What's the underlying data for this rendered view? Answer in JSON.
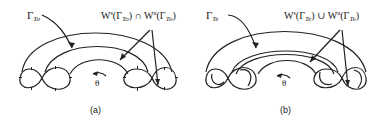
{
  "figure": {
    "panels": [
      {
        "id": "a",
        "caption": "(a)",
        "orbit_label": {
          "symbol": "Γ",
          "subscript": "To"
        },
        "manifold_label": {
          "w1": "W",
          "w1_sup": "s",
          "gamma1": "(Γ",
          "sub1": "To",
          "close1": ")",
          "op": " ∩ ",
          "w2": "W",
          "w2_sup": "u",
          "gamma2": "(Γ",
          "sub2": "To",
          "close2": ")"
        },
        "angle_label": "θ"
      },
      {
        "id": "b",
        "caption": "(b)",
        "orbit_label": {
          "symbol": "Γ",
          "subscript": "Te"
        },
        "manifold_label": {
          "w1": "W",
          "w1_sup": "s",
          "gamma1": "(Γ",
          "sub1": "Te",
          "close1": ")",
          "op": " ∪ ",
          "w2": "W",
          "w2_sup": "u",
          "gamma2": "(Γ",
          "sub2": "Te",
          "close2": ")"
        },
        "angle_label": "θ"
      }
    ]
  }
}
